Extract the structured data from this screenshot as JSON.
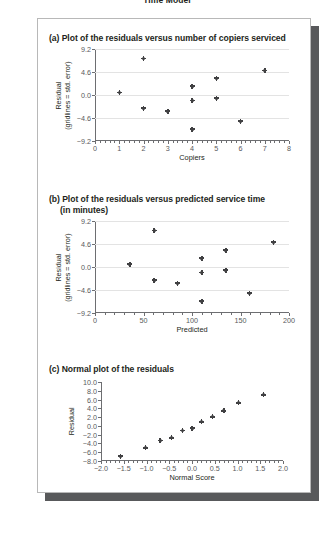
{
  "figure": {
    "caption_clipped": "Time Model"
  },
  "panels": [
    {
      "id": "a",
      "title": "(a) Plot of the residuals versus number of copiers serviced",
      "title_cont": ""
    },
    {
      "id": "b",
      "title": "(b) Plot of the residuals versus predicted service time",
      "title_cont": "(in minutes)"
    },
    {
      "id": "c",
      "title": "(c) Normal plot of the residuals",
      "title_cont": ""
    }
  ],
  "chart_data": [
    {
      "type": "scatter",
      "panel": "a",
      "title": "(a) Plot of the residuals versus number of copiers serviced",
      "xlabel": "Copiers",
      "ylabel_line1": "Residual",
      "ylabel_line2": "(gridlines = std. error)",
      "xlim": [
        0,
        8
      ],
      "ylim": [
        -9.2,
        9.2
      ],
      "xticks": [
        0,
        1,
        2,
        3,
        4,
        5,
        6,
        7,
        8
      ],
      "xticklabels": [
        "0",
        "1",
        "2",
        "3",
        "4",
        "5",
        "6",
        "7",
        "8"
      ],
      "yticks": [
        -9.2,
        -4.6,
        0.0,
        4.6,
        9.2
      ],
      "yticklabels": [
        "-9.2",
        "-4.6",
        "0.0",
        "4.6",
        "9.2"
      ],
      "grid": true,
      "grid_axis": "y",
      "legend": "none",
      "marker": "diamond-plus",
      "x": [
        1.0,
        2.0,
        2.0,
        3.0,
        4.0,
        4.0,
        4.0,
        5.0,
        5.0,
        6.0,
        7.0
      ],
      "y": [
        0.5,
        7.3,
        -2.6,
        -3.2,
        1.8,
        -1.1,
        -6.8,
        3.4,
        -0.6,
        -5.2,
        4.9
      ]
    },
    {
      "type": "scatter",
      "panel": "b",
      "title": "(b) Plot of the residuals versus predicted service time (in minutes)",
      "xlabel": "Predicted",
      "ylabel_line1": "Residual",
      "ylabel_line2": "(gridlines = std. error)",
      "xlim": [
        0,
        200
      ],
      "ylim": [
        -9.2,
        9.2
      ],
      "xticks": [
        0,
        50,
        100,
        150,
        200
      ],
      "xticklabels": [
        "0",
        "50",
        "100",
        "150",
        "200"
      ],
      "yticks": [
        -9.2,
        -4.6,
        0.0,
        4.6,
        9.2
      ],
      "yticklabels": [
        "-9.2",
        "-4.6",
        "0.0",
        "4.6",
        "9.2"
      ],
      "grid": true,
      "grid_axis": "y",
      "legend": "none",
      "marker": "diamond-plus",
      "x": [
        36,
        61,
        61,
        85,
        110,
        110,
        110,
        135,
        135,
        159,
        184
      ],
      "y": [
        0.6,
        7.3,
        -2.6,
        -3.2,
        1.8,
        -1.1,
        -6.8,
        3.4,
        -0.6,
        -5.2,
        5.0
      ]
    },
    {
      "type": "scatter",
      "panel": "c",
      "title": "(c) Normal plot of the residuals",
      "xlabel": "Normal Score",
      "ylabel_line1": "Residual",
      "ylabel_line2": "",
      "xlim": [
        -2.0,
        2.0
      ],
      "ylim": [
        -8.0,
        10.0
      ],
      "xticks": [
        -2.0,
        -1.5,
        -1.0,
        -0.5,
        0.0,
        0.5,
        1.0,
        1.5,
        2.0
      ],
      "xticklabels": [
        "-2.0",
        "-1.5",
        "-1.0",
        "-0.5",
        "0.0",
        "0.5",
        "1.0",
        "1.5",
        "2.0"
      ],
      "yticks": [
        -8.0,
        -6.0,
        -4.0,
        -2.0,
        0.0,
        2.0,
        4.0,
        6.0,
        8.0,
        10.0
      ],
      "yticklabels": [
        "-8.0",
        "-6.0",
        "-4.0",
        "-2.0",
        "0.0",
        "2.0",
        "4.0",
        "6.0",
        "8.0",
        "10.0"
      ],
      "grid": false,
      "legend": "none",
      "marker": "diamond-plus",
      "x": [
        -1.57,
        -1.02,
        -0.7,
        -0.45,
        -0.21,
        0.0,
        0.21,
        0.45,
        0.7,
        1.02,
        1.57
      ],
      "y": [
        -6.9,
        -5.0,
        -3.3,
        -2.7,
        -1.0,
        -0.5,
        0.9,
        2.1,
        3.4,
        5.3,
        7.1
      ]
    }
  ]
}
